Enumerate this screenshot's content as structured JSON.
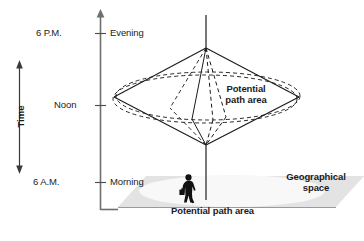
{
  "figure": {
    "background_color": "#ffffff",
    "line_color": "#1b1b1b",
    "ground_fill": "#e2e2e2",
    "ground_inner_fill": "#f7f7f7",
    "text_color": "#1b1b1b"
  },
  "axes": {
    "time_axis_label": "Time",
    "ticks": [
      {
        "time": "6 P.M.",
        "period": "Evening"
      },
      {
        "time": "Noon",
        "period": ""
      },
      {
        "time": "6 A.M.",
        "period": "Morning"
      }
    ]
  },
  "annotations": {
    "prism_label_line1": "Potential",
    "prism_label_line2": "path area",
    "ground_label": "Potential path area",
    "space_label_line1": "Geographical",
    "space_label_line2": "space"
  },
  "icons": {
    "person": "walking-person-icon",
    "axis_arrow": "arrow-up-icon",
    "time_arrow_up": "arrow-up-icon",
    "time_arrow_down": "arrow-down-icon"
  }
}
